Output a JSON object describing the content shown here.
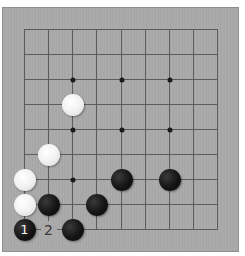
{
  "board": {
    "size": 9,
    "colors": {
      "board": "#a9a9a9",
      "line": "#5c5c5c",
      "black_stone": "#141414",
      "white_stone": "#f2f2f2",
      "label_on_empty": "#3a3a3a"
    },
    "grid": {
      "x": [
        24,
        48,
        72,
        96,
        121,
        145,
        169,
        193,
        217
      ],
      "y": [
        29,
        54,
        79,
        104,
        129,
        154,
        179,
        204,
        229
      ]
    },
    "star_points": [
      {
        "col": 2,
        "row": 2
      },
      {
        "col": 4,
        "row": 2
      },
      {
        "col": 6,
        "row": 2
      },
      {
        "col": 2,
        "row": 4
      },
      {
        "col": 4,
        "row": 4
      },
      {
        "col": 6,
        "row": 4
      },
      {
        "col": 2,
        "row": 6
      },
      {
        "col": 4,
        "row": 6
      },
      {
        "col": 6,
        "row": 6
      }
    ],
    "stones": [
      {
        "color": "white",
        "col": 2,
        "row": 3,
        "label": ""
      },
      {
        "color": "white",
        "col": 1,
        "row": 5,
        "label": ""
      },
      {
        "color": "white",
        "col": 0,
        "row": 6,
        "label": ""
      },
      {
        "color": "white",
        "col": 0,
        "row": 7,
        "label": ""
      },
      {
        "color": "black",
        "col": 4,
        "row": 6,
        "label": ""
      },
      {
        "color": "black",
        "col": 6,
        "row": 6,
        "label": ""
      },
      {
        "color": "black",
        "col": 1,
        "row": 7,
        "label": ""
      },
      {
        "color": "black",
        "col": 3,
        "row": 7,
        "label": ""
      },
      {
        "color": "black",
        "col": 0,
        "row": 8,
        "label": "1"
      },
      {
        "color": "black",
        "col": 2,
        "row": 8,
        "label": ""
      }
    ],
    "labels": [
      {
        "col": 1,
        "row": 8,
        "text": "2"
      }
    ]
  }
}
